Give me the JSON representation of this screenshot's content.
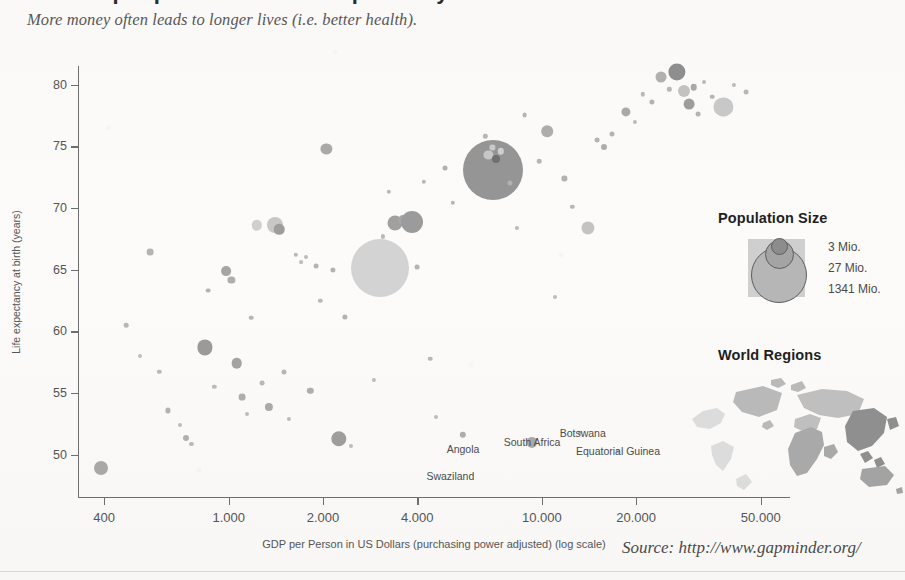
{
  "title_fragment": "Income per person and Life expectancy",
  "subtitle": "More money often leads to longer lives (i.e. better health).",
  "source": "Source: http://www.gapminder.org/",
  "population_legend": {
    "title": "Population Size",
    "labels": [
      "3 Mio.",
      "27 Mio.",
      "1341 Mio."
    ]
  },
  "regions_legend": {
    "title": "World Regions"
  },
  "chart_data": {
    "type": "scatter",
    "title": "Income per person and Life expectancy",
    "subtitle": "More money often leads to longer lives (i.e. better health).",
    "xlabel": "GDP per Person in US Dollars (purchasing power adjusted) (log scale)",
    "ylabel": "Life expectancy at birth (years)",
    "xscale": "log",
    "xlim": [
      330,
      62000
    ],
    "ylim": [
      46.5,
      81.5
    ],
    "xticks": [
      400,
      1000,
      2000,
      4000,
      10000,
      20000,
      50000
    ],
    "xtick_labels": [
      "400",
      "1.000",
      "2.000",
      "4.000",
      "10.000",
      "20.000",
      "50.000"
    ],
    "yticks": [
      50,
      55,
      60,
      65,
      70,
      75,
      80
    ],
    "ytick_labels": [
      "50",
      "75",
      "70",
      "65",
      "60",
      "55",
      "50"
    ],
    "grid": false,
    "legend_position": "right",
    "size_encoding": "population",
    "size_legend_values": [
      3,
      27,
      1341
    ],
    "size_legend_units": "Mio.",
    "annotations": [
      {
        "text": "Angola",
        "x": 5600,
        "y": 50.5
      },
      {
        "text": "Swaziland",
        "x": 5100,
        "y": 48.3
      },
      {
        "text": "South Africa",
        "x": 9300,
        "y": 51.0
      },
      {
        "text": "Botswana",
        "x": 13500,
        "y": 51.8
      },
      {
        "text": "Equatorial Guinea",
        "x": 17500,
        "y": 50.3
      }
    ],
    "points": [
      {
        "x": 390,
        "y": 48.9,
        "r": 7.0,
        "c": "#a8a8a8"
      },
      {
        "x": 470,
        "y": 60.5,
        "r": 2.3,
        "c": "#b6b6b6"
      },
      {
        "x": 520,
        "y": 58.0,
        "r": 2.0,
        "c": "#bdbdbd"
      },
      {
        "x": 560,
        "y": 66.4,
        "r": 3.4,
        "c": "#b4b4b4"
      },
      {
        "x": 600,
        "y": 56.7,
        "r": 2.2,
        "c": "#b9b9b9"
      },
      {
        "x": 640,
        "y": 53.6,
        "r": 2.6,
        "c": "#b2b2b2"
      },
      {
        "x": 700,
        "y": 52.4,
        "r": 2.0,
        "c": "#bcbcbc"
      },
      {
        "x": 730,
        "y": 51.4,
        "r": 3.0,
        "c": "#b0b0b0"
      },
      {
        "x": 760,
        "y": 50.9,
        "r": 2.1,
        "c": "#bababa"
      },
      {
        "x": 840,
        "y": 58.7,
        "r": 7.6,
        "c": "#9a9a9a"
      },
      {
        "x": 860,
        "y": 63.3,
        "r": 2.4,
        "c": "#b4b4b4"
      },
      {
        "x": 900,
        "y": 55.5,
        "r": 2.2,
        "c": "#bbbbbb"
      },
      {
        "x": 980,
        "y": 64.9,
        "r": 4.9,
        "c": "#a5a5a5"
      },
      {
        "x": 1020,
        "y": 64.2,
        "r": 3.6,
        "c": "#aeaeae"
      },
      {
        "x": 1060,
        "y": 57.4,
        "r": 5.3,
        "c": "#a3a3a3"
      },
      {
        "x": 1100,
        "y": 54.7,
        "r": 3.4,
        "c": "#aeaeae"
      },
      {
        "x": 1140,
        "y": 53.3,
        "r": 2.0,
        "c": "#bcbcbc"
      },
      {
        "x": 1180,
        "y": 61.1,
        "r": 2.3,
        "c": "#b5b5b5"
      },
      {
        "x": 1230,
        "y": 68.6,
        "r": 5.2,
        "c": "#cfcfcf"
      },
      {
        "x": 1280,
        "y": 55.8,
        "r": 2.4,
        "c": "#b8b8b8"
      },
      {
        "x": 1340,
        "y": 53.9,
        "r": 4.1,
        "c": "#aaaaaa"
      },
      {
        "x": 1400,
        "y": 68.6,
        "r": 8.0,
        "c": "#c7c7c7"
      },
      {
        "x": 1450,
        "y": 68.3,
        "r": 5.3,
        "c": "#9d9d9d"
      },
      {
        "x": 1500,
        "y": 56.7,
        "r": 2.5,
        "c": "#b6b6b6"
      },
      {
        "x": 1560,
        "y": 52.9,
        "r": 2.1,
        "c": "#bbbbbb"
      },
      {
        "x": 1640,
        "y": 66.2,
        "r": 2.2,
        "c": "#b7b7b7"
      },
      {
        "x": 1700,
        "y": 65.6,
        "r": 1.9,
        "c": "#bdbdbd"
      },
      {
        "x": 1760,
        "y": 66.0,
        "r": 2.0,
        "c": "#bababa"
      },
      {
        "x": 1820,
        "y": 55.2,
        "r": 3.2,
        "c": "#aeaeae"
      },
      {
        "x": 1900,
        "y": 65.3,
        "r": 2.4,
        "c": "#b4b4b4"
      },
      {
        "x": 1960,
        "y": 62.5,
        "r": 2.2,
        "c": "#b8b8b8"
      },
      {
        "x": 2050,
        "y": 74.8,
        "r": 5.6,
        "c": "#a9a9a9"
      },
      {
        "x": 2150,
        "y": 65.0,
        "r": 2.6,
        "c": "#b3b3b3"
      },
      {
        "x": 2250,
        "y": 51.3,
        "r": 7.7,
        "c": "#9d9d9d"
      },
      {
        "x": 2350,
        "y": 61.2,
        "r": 2.6,
        "c": "#b2b2b2"
      },
      {
        "x": 2450,
        "y": 50.7,
        "r": 2.0,
        "c": "#bcbcbc"
      },
      {
        "x": 2600,
        "y": 64.2,
        "r": 2.4,
        "c": "#b5b5b5"
      },
      {
        "x": 2750,
        "y": 63.6,
        "r": 2.2,
        "c": "#b7b7b7"
      },
      {
        "x": 2900,
        "y": 56.1,
        "r": 2.1,
        "c": "#bababa"
      },
      {
        "x": 3050,
        "y": 65.1,
        "r": 29.0,
        "c": "#d3d3d3"
      },
      {
        "x": 3100,
        "y": 67.7,
        "r": 2.1,
        "c": "#b8b8b8"
      },
      {
        "x": 3250,
        "y": 71.3,
        "r": 2.2,
        "c": "#b9b9b9"
      },
      {
        "x": 3400,
        "y": 68.8,
        "r": 7.5,
        "c": "#a0a0a0"
      },
      {
        "x": 3600,
        "y": 69.0,
        "r": 5.0,
        "c": "#a6a6a6"
      },
      {
        "x": 3850,
        "y": 68.9,
        "r": 11.0,
        "c": "#9b9b9b"
      },
      {
        "x": 4000,
        "y": 65.2,
        "r": 2.4,
        "c": "#b4b4b4"
      },
      {
        "x": 4200,
        "y": 72.1,
        "r": 2.2,
        "c": "#b6b6b6"
      },
      {
        "x": 4400,
        "y": 57.8,
        "r": 2.3,
        "c": "#b7b7b7"
      },
      {
        "x": 4600,
        "y": 53.1,
        "r": 2.0,
        "c": "#bcbcbc"
      },
      {
        "x": 4900,
        "y": 73.2,
        "r": 2.5,
        "c": "#b1b1b1"
      },
      {
        "x": 5200,
        "y": 70.4,
        "r": 2.2,
        "c": "#b6b6b6"
      },
      {
        "x": 5600,
        "y": 51.6,
        "r": 3.2,
        "c": "#adadad"
      },
      {
        "x": 5900,
        "y": 74.2,
        "r": 3.1,
        "c": "#b0b0b0"
      },
      {
        "x": 6200,
        "y": 71.8,
        "r": 2.4,
        "c": "#b4b4b4"
      },
      {
        "x": 6600,
        "y": 75.8,
        "r": 2.2,
        "c": "#b7b7b7"
      },
      {
        "x": 7000,
        "y": 73.1,
        "r": 30.0,
        "c": "#959595"
      },
      {
        "x": 6750,
        "y": 74.3,
        "r": 4.6,
        "c": "#c6c6c6"
      },
      {
        "x": 7150,
        "y": 74.0,
        "r": 4.0,
        "c": "#6f6f6f"
      },
      {
        "x": 6950,
        "y": 74.9,
        "r": 2.6,
        "c": "#c9c9c9"
      },
      {
        "x": 7400,
        "y": 74.6,
        "r": 3.2,
        "c": "#cfcfcf"
      },
      {
        "x": 7900,
        "y": 72.0,
        "r": 2.6,
        "c": "#b2b2b2"
      },
      {
        "x": 8300,
        "y": 68.4,
        "r": 2.1,
        "c": "#b9b9b9"
      },
      {
        "x": 8800,
        "y": 77.5,
        "r": 2.4,
        "c": "#b5b5b5"
      },
      {
        "x": 9300,
        "y": 51.0,
        "r": 5.1,
        "c": "#a9a9a9"
      },
      {
        "x": 9800,
        "y": 73.8,
        "r": 2.3,
        "c": "#b6b6b6"
      },
      {
        "x": 10400,
        "y": 76.2,
        "r": 5.8,
        "c": "#adadad"
      },
      {
        "x": 11000,
        "y": 62.8,
        "r": 2.0,
        "c": "#bbbbbb"
      },
      {
        "x": 11800,
        "y": 72.4,
        "r": 2.6,
        "c": "#b2b2b2"
      },
      {
        "x": 12500,
        "y": 70.1,
        "r": 2.2,
        "c": "#b7b7b7"
      },
      {
        "x": 13200,
        "y": 51.8,
        "r": 2.2,
        "c": "#b4b4b4"
      },
      {
        "x": 14000,
        "y": 68.4,
        "r": 6.6,
        "c": "#c3c3c3"
      },
      {
        "x": 15000,
        "y": 75.5,
        "r": 2.4,
        "c": "#b3b3b3"
      },
      {
        "x": 15800,
        "y": 74.9,
        "r": 3.0,
        "c": "#adadad"
      },
      {
        "x": 16800,
        "y": 76.0,
        "r": 2.5,
        "c": "#b4b4b4"
      },
      {
        "x": 17500,
        "y": 50.3,
        "r": 1.9,
        "c": "#bdbdbd"
      },
      {
        "x": 18500,
        "y": 77.8,
        "r": 4.6,
        "c": "#a9a9a9"
      },
      {
        "x": 19800,
        "y": 77.0,
        "r": 2.1,
        "c": "#bababa"
      },
      {
        "x": 21000,
        "y": 79.2,
        "r": 2.2,
        "c": "#b8b8b8"
      },
      {
        "x": 22500,
        "y": 78.6,
        "r": 2.6,
        "c": "#b3b3b3"
      },
      {
        "x": 24000,
        "y": 80.6,
        "r": 5.5,
        "c": "#b0b0b0"
      },
      {
        "x": 25500,
        "y": 79.6,
        "r": 2.2,
        "c": "#b6b6b6"
      },
      {
        "x": 27000,
        "y": 81.0,
        "r": 8.6,
        "c": "#8e8e8e"
      },
      {
        "x": 28500,
        "y": 79.5,
        "r": 6.0,
        "c": "#c2c2c2"
      },
      {
        "x": 29500,
        "y": 78.4,
        "r": 5.4,
        "c": "#9d9d9d"
      },
      {
        "x": 30500,
        "y": 79.8,
        "r": 3.3,
        "c": "#a8a8a8"
      },
      {
        "x": 31500,
        "y": 77.6,
        "r": 2.4,
        "c": "#b4b4b4"
      },
      {
        "x": 33000,
        "y": 80.2,
        "r": 2.0,
        "c": "#b9b9b9"
      },
      {
        "x": 35000,
        "y": 79.0,
        "r": 2.3,
        "c": "#b5b5b5"
      },
      {
        "x": 38000,
        "y": 78.2,
        "r": 9.6,
        "c": "#c8c8c8"
      },
      {
        "x": 41000,
        "y": 80.0,
        "r": 2.1,
        "c": "#bbbbbb"
      },
      {
        "x": 45000,
        "y": 79.4,
        "r": 2.4,
        "c": "#b7b7b7"
      }
    ]
  }
}
